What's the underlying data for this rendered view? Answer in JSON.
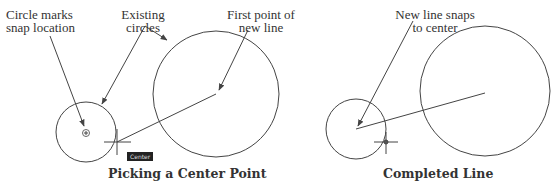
{
  "panels": [
    {
      "caption": "Picking a Center Point",
      "labels": {
        "snap_marker": [
          "Circle marks",
          "snap location"
        ],
        "existing": [
          "Existing",
          "circles"
        ],
        "first_point": [
          "First point of",
          "new line"
        ]
      },
      "tooltip": "Center"
    },
    {
      "caption": "Completed Line",
      "labels": {
        "snaps": [
          "New line snaps",
          "to center"
        ]
      }
    }
  ],
  "colors": {
    "stroke": "#444444",
    "text": "#333333",
    "tooltip_bg": "#222222"
  }
}
